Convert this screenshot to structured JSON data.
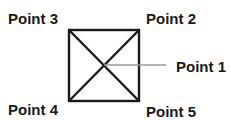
{
  "diagram": {
    "type": "labeled-square-with-diagonals",
    "labels": {
      "point1": "Point 1",
      "point2": "Point 2",
      "point3": "Point 3",
      "point4": "Point 4",
      "point5": "Point 5"
    },
    "colors": {
      "shape_stroke": "#1a1a1a",
      "leader_line": "#9a9a9a",
      "text": "#1a1a1a",
      "background": "#ffffff"
    }
  }
}
